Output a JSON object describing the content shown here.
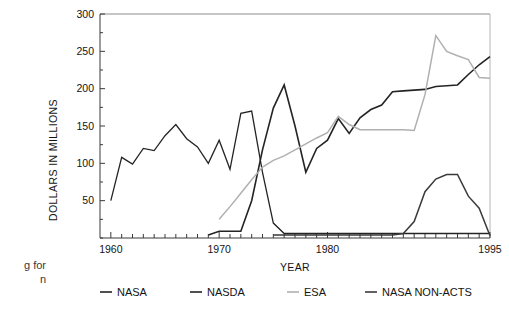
{
  "figure": {
    "caption_fragment": "g for\nn"
  },
  "chart_data": {
    "type": "line",
    "title": "",
    "xlabel": "YEAR",
    "ylabel": "DOLLARS IN MILLIONS",
    "xlim": [
      1959,
      1995
    ],
    "ylim": [
      0,
      300
    ],
    "xticks": [
      1960,
      1961,
      1962,
      1963,
      1964,
      1965,
      1966,
      1967,
      1968,
      1969,
      1970,
      1971,
      1972,
      1973,
      1974,
      1975,
      1976,
      1977,
      1978,
      1979,
      1980,
      1981,
      1982,
      1983,
      1984,
      1985,
      1986,
      1987,
      1988,
      1989,
      1990,
      1991,
      1992,
      1993,
      1994,
      1995
    ],
    "xtick_labels": [
      "1960",
      "1970",
      "1980",
      "1995"
    ],
    "xtick_label_values": [
      1960,
      1970,
      1980,
      1995
    ],
    "yticks": [
      0,
      25,
      50,
      75,
      100,
      125,
      150,
      175,
      200,
      225,
      250,
      275,
      300
    ],
    "ytick_labels": [
      "50",
      "100",
      "150",
      "200",
      "250",
      "300"
    ],
    "ytick_label_values": [
      50,
      100,
      150,
      200,
      250,
      300
    ],
    "grid": false,
    "legend_position": "bottom",
    "series": [
      {
        "name": "NASA",
        "color": "#242424",
        "width": 1.3,
        "points": [
          [
            1960,
            50
          ],
          [
            1961,
            108
          ],
          [
            1962,
            99
          ],
          [
            1963,
            120
          ],
          [
            1964,
            117
          ],
          [
            1965,
            137
          ],
          [
            1966,
            152
          ],
          [
            1967,
            133
          ],
          [
            1968,
            122
          ],
          [
            1969,
            100
          ],
          [
            1970,
            131
          ],
          [
            1971,
            92
          ],
          [
            1972,
            167
          ],
          [
            1973,
            170
          ],
          [
            1974,
            88
          ],
          [
            1975,
            20
          ],
          [
            1976,
            6
          ],
          [
            1977,
            6
          ],
          [
            1978,
            6
          ],
          [
            1979,
            6
          ],
          [
            1980,
            6
          ],
          [
            1981,
            6
          ],
          [
            1982,
            6
          ],
          [
            1983,
            6
          ],
          [
            1984,
            6
          ],
          [
            1985,
            6
          ],
          [
            1986,
            6
          ],
          [
            1987,
            6
          ],
          [
            1988,
            6
          ],
          [
            1989,
            6
          ],
          [
            1990,
            6
          ],
          [
            1991,
            6
          ],
          [
            1992,
            6
          ],
          [
            1993,
            6
          ],
          [
            1994,
            6
          ],
          [
            1995,
            6
          ]
        ]
      },
      {
        "name": "NASDA",
        "color": "#242424",
        "width": 1.6,
        "points": [
          [
            1969,
            4
          ],
          [
            1970,
            9
          ],
          [
            1971,
            9
          ],
          [
            1972,
            9
          ],
          [
            1973,
            50
          ],
          [
            1974,
            118
          ],
          [
            1975,
            174
          ],
          [
            1976,
            205
          ],
          [
            1977,
            150
          ],
          [
            1978,
            88
          ],
          [
            1979,
            120
          ],
          [
            1980,
            131
          ],
          [
            1981,
            160
          ],
          [
            1982,
            140
          ],
          [
            1983,
            161
          ],
          [
            1984,
            172
          ],
          [
            1985,
            178
          ],
          [
            1986,
            196
          ],
          [
            1987,
            197
          ],
          [
            1988,
            198
          ],
          [
            1989,
            199
          ],
          [
            1990,
            203
          ],
          [
            1991,
            204
          ],
          [
            1992,
            205
          ],
          [
            1993,
            219
          ],
          [
            1994,
            232
          ],
          [
            1995,
            243
          ]
        ]
      },
      {
        "name": "ESA",
        "color": "#b0b0b0",
        "width": 1.5,
        "points": [
          [
            1970,
            25
          ],
          [
            1971,
            42
          ],
          [
            1972,
            60
          ],
          [
            1973,
            78
          ],
          [
            1974,
            95
          ],
          [
            1975,
            104
          ],
          [
            1976,
            110
          ],
          [
            1977,
            118
          ],
          [
            1978,
            126
          ],
          [
            1979,
            134
          ],
          [
            1980,
            141
          ],
          [
            1981,
            163
          ],
          [
            1982,
            152
          ],
          [
            1983,
            145
          ],
          [
            1984,
            145
          ],
          [
            1985,
            145
          ],
          [
            1986,
            145
          ],
          [
            1987,
            145
          ],
          [
            1988,
            144
          ],
          [
            1989,
            192
          ],
          [
            1990,
            271
          ],
          [
            1991,
            250
          ],
          [
            1992,
            244
          ],
          [
            1993,
            239
          ],
          [
            1994,
            215
          ],
          [
            1995,
            214
          ]
        ]
      },
      {
        "name": "NASA NON-ACTS",
        "color": "#3a3a3a",
        "width": 1.5,
        "points": [
          [
            1975,
            4
          ],
          [
            1976,
            4
          ],
          [
            1977,
            4
          ],
          [
            1978,
            4
          ],
          [
            1979,
            4
          ],
          [
            1980,
            4
          ],
          [
            1981,
            4
          ],
          [
            1982,
            4
          ],
          [
            1983,
            4
          ],
          [
            1984,
            4
          ],
          [
            1985,
            4
          ],
          [
            1986,
            4
          ],
          [
            1987,
            6
          ],
          [
            1988,
            22
          ],
          [
            1989,
            62
          ],
          [
            1990,
            79
          ],
          [
            1991,
            85
          ],
          [
            1992,
            85
          ],
          [
            1993,
            56
          ],
          [
            1994,
            40
          ],
          [
            1995,
            3
          ]
        ]
      }
    ],
    "legend": [
      {
        "label": "NASA",
        "color": "#242424"
      },
      {
        "label": "NASDA",
        "color": "#242424"
      },
      {
        "label": "ESA",
        "color": "#b0b0b0"
      },
      {
        "label": "NASA NON-ACTS",
        "color": "#3a3a3a"
      }
    ]
  }
}
